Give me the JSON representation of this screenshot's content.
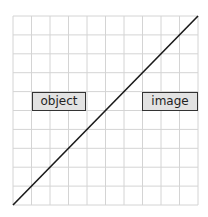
{
  "diagram": {
    "grid": {
      "cols": 10,
      "rows": 10,
      "x0": 13,
      "y0": 16,
      "x1": 198,
      "y1": 205,
      "line_color": "#d4d4d4"
    },
    "diagonal": {
      "from": [
        13,
        205
      ],
      "to": [
        198,
        16
      ],
      "color": "#1a1a1a"
    },
    "labels": {
      "object": "object",
      "image": "image"
    },
    "box_fill": "#e2e2e2"
  }
}
